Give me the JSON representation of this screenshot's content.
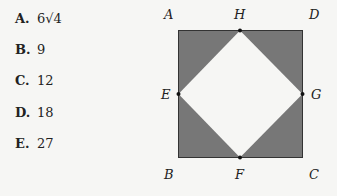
{
  "answer_choices": [
    {
      "letter": "A.",
      "value": "6√4"
    },
    {
      "letter": "B.",
      "value": "9"
    },
    {
      "letter": "C.",
      "value": "12"
    },
    {
      "letter": "D.",
      "value": "18"
    },
    {
      "letter": "E.",
      "value": "27"
    }
  ],
  "figure": {
    "square_fill": "#777777",
    "inner_fill": "#f6f6f4",
    "labels": {
      "A": "A",
      "H": "H",
      "D": "D",
      "E": "E",
      "G": "G",
      "B": "B",
      "F": "F",
      "C": "C"
    }
  }
}
